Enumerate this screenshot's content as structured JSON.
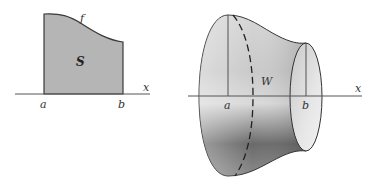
{
  "figure_left": {
    "region_label": "S",
    "curve_label": "f",
    "axis_label": "x",
    "tick_a": "a",
    "tick_b": "b",
    "region_color": "#b3b3b3",
    "stroke_color": "#333333"
  },
  "figure_right": {
    "solid_label": "W",
    "axis_label": "x",
    "tick_a": "a",
    "tick_b": "b",
    "stroke_color": "#333333"
  }
}
